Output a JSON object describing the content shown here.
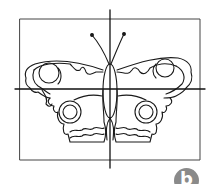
{
  "figure": {
    "frame": {
      "x": 20,
      "y": 19,
      "width": 180,
      "height": 141
    },
    "vertical_axis": {
      "x": 110,
      "y1": 10,
      "y2": 168
    },
    "horizontal_axis": {
      "y": 89,
      "x1": 15,
      "x2": 205
    },
    "stroke_color": "#1a1a1a",
    "background_color": "#ffffff"
  },
  "badge": {
    "label": "b",
    "color": "#8a8a8a",
    "text_color": "#ffffff"
  }
}
